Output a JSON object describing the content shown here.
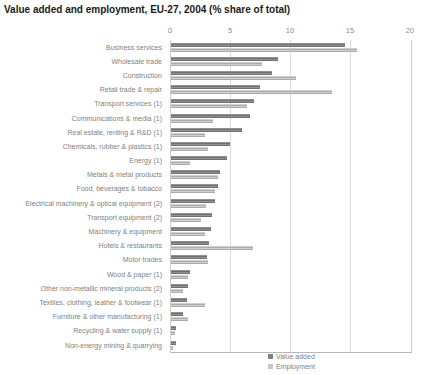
{
  "title": "Value added and employment, EU-27, 2004 (% share of total)",
  "colors": {
    "value_added": "#828282",
    "employment": "#c8c8c8",
    "gridline": "#dcdcdc",
    "axis_text": "#8c8c8c",
    "label_text": "#7f7f7f",
    "title_text": "#1a1a1a"
  },
  "axis": {
    "ticks": [
      "0",
      "5",
      "10",
      "15",
      "20"
    ],
    "max": 20
  },
  "legend": [
    {
      "label": "Value added",
      "color_key": "value_added"
    },
    {
      "label": "Employment",
      "color_key": "employment"
    }
  ],
  "chart_data": {
    "type": "bar",
    "orientation": "horizontal",
    "title": "Value added and employment, EU-27, 2004 (% share of total)",
    "xlabel": "",
    "ylabel": "",
    "xlim": [
      0,
      20
    ],
    "grid": true,
    "legend_position": "bottom",
    "categories": [
      "Business services",
      "Wholesale trade",
      "Construction",
      "Retail trade & repair",
      "Transport services (1)",
      "Communications & media (1)",
      "Real estate, renting & R&D (1)",
      "Chemicals, rubber & plastics (1)",
      "Energy (1)",
      "Metals & metal products",
      "Food, beverages & tobacco",
      "Electrical machinery & optical equipment (2)",
      "Transport equipment (2)",
      "Machinery & equipment",
      "Hotels & restaurants",
      "Motor trades",
      "Wood & paper (1)",
      "Other non-metallic mineral products (2)",
      "Textiles, clothing, leather & footwear (1)",
      "Furniture & other manufacturing (1)",
      "Recycling & water supply (1)",
      "Non-energy mining & quarrying"
    ],
    "series": [
      {
        "name": "Value added",
        "values": [
          14.5,
          8.9,
          8.4,
          7.4,
          6.9,
          6.6,
          5.9,
          4.9,
          4.7,
          4.1,
          3.9,
          3.7,
          3.4,
          3.3,
          3.2,
          3.0,
          1.6,
          1.4,
          1.3,
          1.0,
          0.4,
          0.4
        ]
      },
      {
        "name": "Employment",
        "values": [
          15.5,
          7.6,
          10.4,
          13.4,
          6.3,
          3.5,
          2.8,
          3.1,
          1.6,
          3.9,
          3.7,
          2.9,
          2.5,
          2.8,
          6.8,
          3.1,
          1.4,
          1.0,
          2.8,
          1.4,
          0.3,
          0.2
        ]
      }
    ]
  }
}
